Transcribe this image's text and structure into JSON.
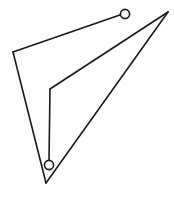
{
  "figure": {
    "background_color": "#ffffff",
    "stroke_color": "#1a1a1a",
    "marker_fill_color": "#ffffff",
    "stroke_width": 1.6,
    "marker_stroke_width": 1.6,
    "canvas": {
      "width": 174,
      "height": 200
    },
    "points": {
      "left_vertex": {
        "x": 13,
        "y": 52
      },
      "apex_vertex": {
        "x": 168,
        "y": 12
      },
      "bottom_vertex": {
        "x": 46,
        "y": 183
      },
      "bend_vertex": {
        "x": 50,
        "y": 89
      },
      "top_node": {
        "x": 125,
        "y": 14
      },
      "bottom_node": {
        "x": 49,
        "y": 161
      }
    },
    "markers": [
      {
        "name": "top-node",
        "cx": 125,
        "cy": 14,
        "r": 4.6,
        "label": "node-a"
      },
      {
        "name": "bottom-node",
        "cx": 49,
        "cy": 165,
        "r": 4.6,
        "label": "node-b"
      }
    ],
    "paths": {
      "outer_left_edge": "M 13 52 L 46 183",
      "outer_right_edge": "M 46 183 L 168 12",
      "top_edge": "M 13 52 L 120.6 14.7",
      "inner_diagonal": "M 168 12 L 50 89",
      "inner_vertical": "M 50 89 L 49 160.4"
    }
  }
}
